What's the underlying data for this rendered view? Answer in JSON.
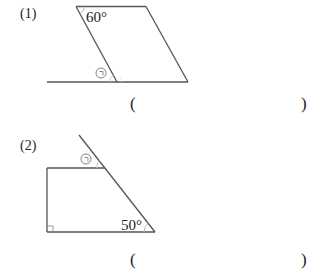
{
  "problems": [
    {
      "number": "(1)",
      "figure": "parallelogram",
      "given_angle": "60°",
      "unknown_marker": "㉠",
      "answer_open": "(",
      "answer_close": ")"
    },
    {
      "number": "(2)",
      "figure": "trapezoid",
      "given_angle": "50°",
      "unknown_marker": "㉠",
      "right_angle": true,
      "answer_open": "(",
      "answer_close": ")"
    }
  ],
  "colors": {
    "line": "#555555",
    "arc": "#bbbbbb",
    "text": "#222222"
  }
}
